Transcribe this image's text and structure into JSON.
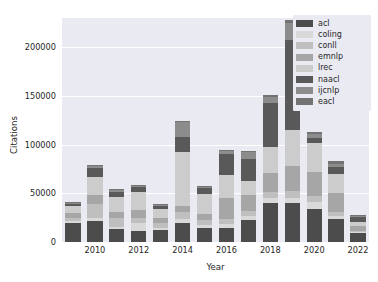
{
  "chart_data": {
    "type": "bar",
    "stacked": true,
    "title": "",
    "xlabel": "Year",
    "ylabel": "Citations",
    "categories": [
      "2009",
      "2010",
      "2011",
      "2012",
      "2013",
      "2014",
      "2015",
      "2016",
      "2017",
      "2018",
      "2019",
      "2020",
      "2021",
      "2022"
    ],
    "xtick_labels": [
      "2010",
      "2012",
      "2014",
      "2016",
      "2018",
      "2020",
      "2022"
    ],
    "xtick_categories": [
      "2010",
      "2012",
      "2014",
      "2016",
      "2018",
      "2020",
      "2022"
    ],
    "ytick_labels": [
      "0",
      "50000",
      "100000",
      "150000",
      "200000"
    ],
    "ytick_values": [
      0,
      50000,
      100000,
      150000,
      200000
    ],
    "ylim": [
      0,
      230000
    ],
    "grid": true,
    "legend_position": "upper right",
    "series": [
      {
        "name": "acl",
        "color": "#4c4c4c",
        "values": [
          20000,
          22000,
          13000,
          11000,
          12000,
          20000,
          14000,
          14000,
          23000,
          40000,
          40000,
          34000,
          24000,
          9000
        ]
      },
      {
        "name": "coling",
        "color": "#d9d9d9",
        "values": [
          2000,
          3000,
          2000,
          9000,
          2000,
          4000,
          3000,
          4000,
          4000,
          5000,
          5000,
          7000,
          3000,
          1000
        ]
      },
      {
        "name": "conll",
        "color": "#bfbfbf",
        "values": [
          3000,
          14000,
          10000,
          5000,
          6000,
          7000,
          6000,
          6000,
          5000,
          6000,
          7000,
          6000,
          4000,
          1000
        ]
      },
      {
        "name": "emnlp",
        "color": "#a6a6a6",
        "values": [
          5000,
          9000,
          6000,
          8000,
          5000,
          6000,
          6000,
          21000,
          16000,
          20000,
          26000,
          25000,
          19000,
          5000
        ]
      },
      {
        "name": "lrec",
        "color": "#cccccc",
        "values": [
          7000,
          19000,
          15000,
          18000,
          9000,
          55000,
          20000,
          24000,
          15000,
          27000,
          37000,
          30000,
          20000,
          5000
        ]
      },
      {
        "name": "naacl",
        "color": "#595959",
        "values": [
          2000,
          9000,
          5000,
          5000,
          3000,
          16000,
          6000,
          21000,
          22000,
          45000,
          92000,
          5000,
          7000,
          5000
        ]
      },
      {
        "name": "ijcnlp",
        "color": "#8c8c8c",
        "values": [
          1000,
          2000,
          2000,
          2000,
          1000,
          15000,
          2000,
          3000,
          7000,
          6000,
          18000,
          4000,
          3000,
          1000
        ]
      },
      {
        "name": "eacl",
        "color": "#737373",
        "values": [
          1000,
          1000,
          1000,
          1000,
          1000,
          1000,
          1000,
          1000,
          1000,
          2000,
          3000,
          2000,
          3000,
          1000
        ]
      }
    ],
    "totals": [
      41000,
      79000,
      54000,
      59000,
      39000,
      124000,
      58000,
      94000,
      93000,
      151000,
      228000,
      113000,
      83000,
      28000
    ]
  },
  "legend": {
    "items": [
      {
        "label": "acl"
      },
      {
        "label": "coling"
      },
      {
        "label": "conll"
      },
      {
        "label": "emnlp"
      },
      {
        "label": "lrec"
      },
      {
        "label": "naacl"
      },
      {
        "label": "ijcnlp"
      },
      {
        "label": "eacl"
      }
    ]
  },
  "style": {
    "plot_background": "#eaeaf2",
    "figure_background": "#ffffff",
    "grid_color": "#ffffff",
    "text_color": "#262626"
  }
}
